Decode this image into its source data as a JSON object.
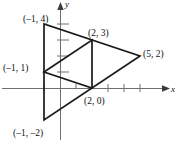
{
  "figure": {
    "title": "",
    "axes": {
      "x_axis_label": "x",
      "y_axis_label": "y",
      "origin_px": [
        60,
        88
      ],
      "unit_px": 16,
      "x_ticks": [
        -1,
        1,
        3,
        4,
        5
      ],
      "y_ticks": [
        1,
        2,
        3,
        4
      ],
      "arrow_x": true,
      "arrow_y": true,
      "axis_color": "#6f6f6f"
    },
    "shapes": [
      {
        "name": "outer-triangle",
        "vertices": [
          [
            -1,
            4
          ],
          [
            -1,
            -2
          ],
          [
            5,
            2
          ]
        ],
        "closed": true,
        "stroke": "#1a1a1a"
      },
      {
        "name": "inner-triangle",
        "vertices": [
          [
            -1,
            1
          ],
          [
            2,
            3
          ],
          [
            2,
            0
          ]
        ],
        "closed": true,
        "stroke": "#1a1a1a"
      }
    ],
    "point_labels": [
      {
        "id": "label-neg1-4",
        "text": "(–1, 4)",
        "point": [
          -1,
          4
        ],
        "px": [
          23,
          14
        ]
      },
      {
        "id": "label-2-3",
        "text": "(2, 3)",
        "point": [
          2,
          3
        ],
        "px": [
          88,
          28
        ]
      },
      {
        "id": "label-5-2",
        "text": "(5, 2)",
        "point": [
          5,
          2
        ],
        "px": [
          143,
          50
        ]
      },
      {
        "id": "label-neg1-1",
        "text": "(–1, 1)",
        "point": [
          -1,
          1
        ],
        "px": [
          3,
          63
        ]
      },
      {
        "id": "label-2-0",
        "text": "(2, 0)",
        "point": [
          2,
          0
        ],
        "px": [
          84,
          96
        ]
      },
      {
        "id": "label-neg1-neg2",
        "text": "(–1, –2)",
        "point": [
          -1,
          -2
        ],
        "px": [
          13,
          121
        ]
      }
    ]
  }
}
